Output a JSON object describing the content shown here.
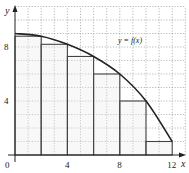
{
  "chart_data": {
    "type": "line",
    "title": "",
    "xlabel": "x",
    "ylabel": "y",
    "xlim": [
      0,
      13
    ],
    "ylim": [
      0,
      11
    ],
    "grid": true,
    "x_ticks": [
      {
        "value": 0,
        "label": "0"
      },
      {
        "value": 4,
        "label": "4"
      },
      {
        "value": 8,
        "label": "8"
      },
      {
        "value": 12,
        "label": "12"
      }
    ],
    "y_ticks": [
      {
        "value": 4,
        "label": "4"
      },
      {
        "value": 8,
        "label": "8"
      }
    ],
    "series": [
      {
        "name": "y = f(x)",
        "x": [
          0,
          2,
          4,
          6,
          8,
          10,
          12
        ],
        "y": [
          9,
          8.8,
          8.2,
          7.3,
          6,
          4,
          1
        ]
      }
    ],
    "rectangles": {
      "description": "Inscribed (right-endpoint) Riemann rectangles, width 2",
      "x_left": [
        0,
        2,
        4,
        6,
        8,
        10
      ],
      "width": 2,
      "heights": [
        8.8,
        8.2,
        7.3,
        6,
        4,
        1
      ]
    },
    "annotations": [
      {
        "text": "y = f(x)",
        "x": 9.1,
        "y": 8.5
      }
    ],
    "legend": null
  },
  "colors": {
    "curve": "#222222",
    "rect": "#444444",
    "grid": "#9a9a9a",
    "axis": "#222222"
  }
}
